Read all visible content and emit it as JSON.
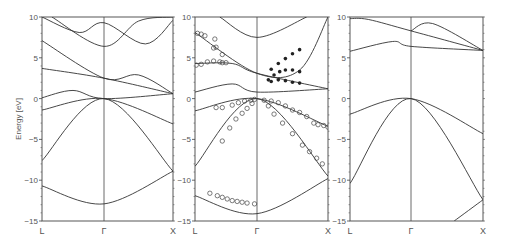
{
  "chart_data": [
    {
      "type": "line",
      "panel": "left",
      "title": "",
      "xlabel": "",
      "ylabel": "Energy  [eV]",
      "x_ticks": [
        "L",
        "Γ",
        "X"
      ],
      "y_ticks": [
        10,
        5,
        0,
        -5,
        -10,
        -15
      ],
      "ylim": [
        -15,
        10
      ],
      "grid": false,
      "series": [
        {
          "name": "band1",
          "x": [
            0,
            0.5,
            1
          ],
          "values": [
            -10.7,
            -12.9,
            -8.9
          ]
        },
        {
          "name": "band2",
          "x": [
            0,
            0.5,
            1
          ],
          "values": [
            -7.6,
            0.0,
            -8.9
          ]
        },
        {
          "name": "band3",
          "x": [
            0,
            0.5,
            1
          ],
          "values": [
            -1.4,
            0.0,
            -3.1
          ]
        },
        {
          "name": "band4",
          "x": [
            0,
            0.25,
            0.5,
            1
          ],
          "values": [
            0.1,
            1.0,
            0.0,
            0.6
          ]
        },
        {
          "name": "band5",
          "x": [
            0,
            0.5,
            1
          ],
          "values": [
            3.7,
            2.5,
            0.6
          ]
        },
        {
          "name": "band6",
          "x": [
            0,
            0.5,
            0.75,
            1
          ],
          "values": [
            7.1,
            2.5,
            2.9,
            0.6
          ]
        },
        {
          "name": "band7",
          "x": [
            0.08,
            0.5,
            0.75,
            1
          ],
          "values": [
            10,
            6.4,
            9.5,
            10
          ]
        },
        {
          "name": "band8",
          "x": [
            0,
            0.3,
            0.5,
            0.8,
            1
          ],
          "values": [
            10,
            8.1,
            9.3,
            6.7,
            9.6
          ]
        }
      ]
    },
    {
      "type": "line+scatter",
      "panel": "middle",
      "x_ticks": [
        "L",
        "Γ",
        "X"
      ],
      "y_ticks": [
        10,
        5,
        0,
        -5,
        -10,
        -15
      ],
      "ylim": [
        -15,
        10
      ],
      "series": [
        {
          "name": "band1",
          "x": [
            0,
            0.5,
            1
          ],
          "values": [
            -11.9,
            -14.1,
            -9.8
          ]
        },
        {
          "name": "band2",
          "x": [
            0,
            0.5,
            1
          ],
          "values": [
            -8.3,
            0.0,
            -9.5
          ]
        },
        {
          "name": "band3",
          "x": [
            0,
            0.5,
            1
          ],
          "values": [
            -1.5,
            0.0,
            -3.4
          ]
        },
        {
          "name": "band4",
          "x": [
            0,
            0.3,
            0.5,
            1
          ],
          "values": [
            0.8,
            1.8,
            0.8,
            1.2
          ]
        },
        {
          "name": "band5",
          "x": [
            0,
            0.3,
            0.5,
            1
          ],
          "values": [
            4.3,
            4.3,
            3.1,
            1.2
          ]
        },
        {
          "name": "band6",
          "x": [
            0,
            0.5,
            0.8,
            1
          ],
          "values": [
            8.1,
            3.1,
            3.5,
            10
          ]
        },
        {
          "name": "band7",
          "x": [
            0.2,
            0.5,
            0.85
          ],
          "values": [
            10,
            7.5,
            10
          ]
        }
      ],
      "open_circles": [
        [
          0.02,
          8.0
        ],
        [
          0.05,
          7.9
        ],
        [
          0.08,
          7.7
        ],
        [
          0.16,
          7.3
        ],
        [
          0.17,
          6.3
        ],
        [
          0.22,
          5.4
        ],
        [
          0.15,
          6.2
        ],
        [
          0.01,
          4.1
        ],
        [
          0.05,
          4.2
        ],
        [
          0.1,
          4.5
        ],
        [
          0.15,
          4.6
        ],
        [
          0.2,
          4.5
        ],
        [
          0.25,
          4.4
        ],
        [
          0.22,
          4.4
        ],
        [
          0.17,
          -1.1
        ],
        [
          0.22,
          -1.1
        ],
        [
          0.3,
          -0.8
        ],
        [
          0.35,
          -0.5
        ],
        [
          0.4,
          -0.3
        ],
        [
          0.45,
          -0.2
        ],
        [
          0.48,
          -0.1
        ],
        [
          0.22,
          -5.2
        ],
        [
          0.28,
          -3.6
        ],
        [
          0.33,
          -2.5
        ],
        [
          0.38,
          -1.8
        ],
        [
          0.42,
          -1.2
        ],
        [
          0.46,
          -0.6
        ],
        [
          0.55,
          -0.2
        ],
        [
          0.6,
          -0.3
        ],
        [
          0.65,
          -0.5
        ],
        [
          0.7,
          -0.9
        ],
        [
          0.75,
          -1.4
        ],
        [
          0.8,
          -1.7
        ],
        [
          0.85,
          -2.2
        ],
        [
          0.9,
          -3.0
        ],
        [
          0.93,
          -3.2
        ],
        [
          0.97,
          -3.3
        ],
        [
          1.0,
          -3.5
        ],
        [
          0.58,
          -0.9
        ],
        [
          0.62,
          -1.9
        ],
        [
          0.68,
          -3.0
        ],
        [
          0.75,
          -4.3
        ],
        [
          0.82,
          -5.7
        ],
        [
          0.87,
          -6.5
        ],
        [
          0.92,
          -7.3
        ],
        [
          0.96,
          -8.0
        ],
        [
          0.12,
          -11.6
        ],
        [
          0.18,
          -11.9
        ],
        [
          0.22,
          -12.1
        ],
        [
          0.26,
          -12.3
        ],
        [
          0.3,
          -12.5
        ],
        [
          0.34,
          -12.6
        ],
        [
          0.38,
          -12.7
        ],
        [
          0.42,
          -12.8
        ],
        [
          0.48,
          -12.9
        ]
      ],
      "filled_dots": [
        [
          0.6,
          3.6
        ],
        [
          0.65,
          4.3
        ],
        [
          0.7,
          4.9
        ],
        [
          0.75,
          5.5
        ],
        [
          0.8,
          6.0
        ],
        [
          0.58,
          2.3
        ],
        [
          0.62,
          2.9
        ],
        [
          0.66,
          3.3
        ],
        [
          0.7,
          3.5
        ],
        [
          0.75,
          3.5
        ],
        [
          0.8,
          3.3
        ],
        [
          0.6,
          2.1
        ],
        [
          0.65,
          2.3
        ],
        [
          0.7,
          2.2
        ],
        [
          0.75,
          2.0
        ],
        [
          0.8,
          1.9
        ]
      ]
    },
    {
      "type": "line",
      "panel": "right",
      "x_ticks": [
        "L",
        "Γ",
        "X"
      ],
      "y_ticks": [
        10,
        5,
        0,
        -5,
        -10,
        -15
      ],
      "ylim": [
        -15,
        10
      ],
      "series": [
        {
          "name": "band1",
          "x": [
            0,
            0.5,
            1
          ],
          "values": [
            -10.4,
            0.0,
            -12.4
          ]
        },
        {
          "name": "band2",
          "x": [
            0,
            0.5,
            1
          ],
          "values": [
            -1.9,
            0.0,
            -4.3
          ]
        },
        {
          "name": "band3",
          "x": [
            0,
            0.35,
            0.5,
            1
          ],
          "values": [
            5.8,
            7.0,
            6.4,
            5.9
          ]
        },
        {
          "name": "band4",
          "x": [
            0,
            0.15,
            0.5,
            1
          ],
          "values": [
            9.8,
            9.7,
            8.3,
            5.9
          ]
        },
        {
          "name": "band5",
          "x": [
            0.5,
            0.65,
            1
          ],
          "values": [
            8.3,
            9.2,
            5.9
          ]
        },
        {
          "name": "band6",
          "x": [
            0.8,
            1
          ],
          "values": [
            -15,
            -12.4
          ]
        }
      ]
    }
  ],
  "panels": [
    {
      "y_ticks": [
        "10",
        "5",
        "0",
        "−5",
        "−10",
        "−15"
      ],
      "x_ticks": [
        "L",
        "Γ",
        "X"
      ]
    },
    {
      "y_ticks": [
        "10",
        "5",
        "0",
        "−5",
        "−10",
        "−15"
      ],
      "x_ticks": [
        "L",
        "Γ",
        "X"
      ]
    },
    {
      "y_ticks": [
        "10",
        "5",
        "0",
        "−5",
        "−10",
        "−15"
      ],
      "x_ticks": [
        "L",
        "Γ",
        "X"
      ]
    }
  ],
  "ylabel": "Energy  [eV]",
  "colors": {
    "line": "#333333",
    "axis": "#444444",
    "text": "#555555"
  }
}
